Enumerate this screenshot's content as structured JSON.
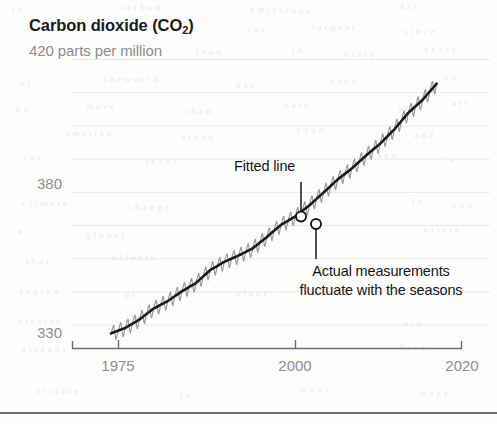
{
  "header": {
    "title_main": "Carbon dioxide (CO",
    "title_sub": "2",
    "title_close": ")",
    "title_full": "Carbon dioxide (CO2)",
    "subtitle": "420 parts per million"
  },
  "annotations": {
    "fitted": "Fitted line",
    "actual_line1": "Actual measurements",
    "actual_line2": "fluctuate with the seasons"
  },
  "axis": {
    "y_ticks": [
      "380",
      "330"
    ],
    "x_ticks": [
      "1975",
      "2000",
      "2020"
    ]
  },
  "colors": {
    "fitted_line": "#1a1a1a",
    "measurement_line": "#9a9a9a",
    "gridline": "#e8e8e6",
    "axis": "#6f6f6f",
    "tick_label": "#8e8e8e",
    "title": "#1b1b1b",
    "subtitle": "#8c8c8c",
    "background": "#fdfdfc"
  },
  "ghost_text": [
    {
      "x": 12,
      "y": 4,
      "t": "i n",
      "r": -1
    },
    {
      "x": 120,
      "y": 2,
      "t": "c a r b o n",
      "r": 0
    },
    {
      "x": 250,
      "y": 5,
      "t": "e m i s s i o n s",
      "r": 1
    },
    {
      "x": 400,
      "y": 1,
      "t": "a r e",
      "r": 0
    },
    {
      "x": 248,
      "y": 24,
      "t": "t h e",
      "r": 0
    },
    {
      "x": 312,
      "y": 22,
      "t": "l a r g e s t",
      "r": 0
    },
    {
      "x": 404,
      "y": 26,
      "t": "s i n c e",
      "r": 0
    },
    {
      "x": 196,
      "y": 47,
      "t": "t h a n",
      "r": 0
    },
    {
      "x": 292,
      "y": 45,
      "t": "i n",
      "r": 0
    },
    {
      "x": 344,
      "y": 49,
      "t": "e a r l y",
      "r": 0
    },
    {
      "x": 424,
      "y": 44,
      "t": "y e a r s",
      "r": 0
    },
    {
      "x": 20,
      "y": 78,
      "t": "o f",
      "r": 0
    },
    {
      "x": 104,
      "y": 74,
      "t": "t h e  w o r l d",
      "r": 0
    },
    {
      "x": 236,
      "y": 80,
      "t": "h a s",
      "r": 0
    },
    {
      "x": 330,
      "y": 76,
      "t": "b e e n",
      "r": 0
    },
    {
      "x": 444,
      "y": 72,
      "t": "u p",
      "r": 0
    },
    {
      "x": 16,
      "y": 104,
      "t": "b y",
      "r": 0
    },
    {
      "x": 86,
      "y": 101,
      "t": "m o r e",
      "r": 0
    },
    {
      "x": 186,
      "y": 106,
      "t": "t h a n",
      "r": 0
    },
    {
      "x": 284,
      "y": 100,
      "t": "h a l f",
      "r": 0
    },
    {
      "x": 398,
      "y": 103,
      "t": "o f",
      "r": 0
    },
    {
      "x": 452,
      "y": 98,
      "t": "a l l",
      "r": 0
    },
    {
      "x": 66,
      "y": 128,
      "t": "e m i t t e d",
      "r": 0
    },
    {
      "x": 182,
      "y": 132,
      "t": "s i n c e",
      "r": 0
    },
    {
      "x": 296,
      "y": 126,
      "t": "1 9 9 0",
      "r": 0
    },
    {
      "x": 414,
      "y": 130,
      "t": "a n d",
      "r": 0
    },
    {
      "x": 24,
      "y": 152,
      "t": "t h e",
      "r": 0
    },
    {
      "x": 146,
      "y": 156,
      "t": "l e v e l",
      "r": 0
    },
    {
      "x": 366,
      "y": 150,
      "t": "r i s e n",
      "r": 0
    },
    {
      "x": 444,
      "y": 154,
      "t": "f a r",
      "r": 0
    },
    {
      "x": 22,
      "y": 198,
      "t": "c l i m a t e",
      "r": 0
    },
    {
      "x": 128,
      "y": 202,
      "t": "c h a n g e",
      "r": 0
    },
    {
      "x": 412,
      "y": 196,
      "t": "i s",
      "r": 0
    },
    {
      "x": 452,
      "y": 200,
      "t": "n o w",
      "r": 0
    },
    {
      "x": 18,
      "y": 226,
      "t": "a",
      "r": 0
    },
    {
      "x": 86,
      "y": 230,
      "t": "g l o b a l",
      "r": 0
    },
    {
      "x": 424,
      "y": 224,
      "t": "c r i s i s",
      "r": 0
    },
    {
      "x": 26,
      "y": 256,
      "t": "t h a t",
      "r": 0
    },
    {
      "x": 112,
      "y": 252,
      "t": "a f f e c t s",
      "r": 0
    },
    {
      "x": 208,
      "y": 258,
      "t": "e v e r y",
      "r": 0
    },
    {
      "x": 20,
      "y": 286,
      "t": "r e g i o n",
      "r": 0
    },
    {
      "x": 124,
      "y": 290,
      "t": "o f",
      "r": 0
    },
    {
      "x": 180,
      "y": 284,
      "t": "t h e",
      "r": 0
    },
    {
      "x": 236,
      "y": 288,
      "t": "p l a n e t",
      "r": 0
    },
    {
      "x": 420,
      "y": 284,
      "t": "w i t h",
      "r": 0
    },
    {
      "x": 18,
      "y": 316,
      "t": "e f f e c t s",
      "r": 0
    },
    {
      "x": 126,
      "y": 312,
      "t": "t h a t",
      "r": 0
    },
    {
      "x": 404,
      "y": 318,
      "t": "a r e",
      "r": 0
    },
    {
      "x": 22,
      "y": 344,
      "t": "a l r e a d y",
      "r": 0
    },
    {
      "x": 400,
      "y": 342,
      "t": "h e r e",
      "r": 0
    },
    {
      "x": 36,
      "y": 386,
      "t": "v i s i b l e",
      "r": 0
    },
    {
      "x": 180,
      "y": 390,
      "t": "i n",
      "r": 0
    },
    {
      "x": 300,
      "y": 384,
      "t": "m a n y",
      "r": 0
    },
    {
      "x": 420,
      "y": 388,
      "t": "w a y s",
      "r": 0
    }
  ],
  "chart_data": {
    "type": "line",
    "title": "Carbon dioxide (CO2)",
    "subtitle": "420 parts per million",
    "xlabel": "",
    "ylabel": "parts per million",
    "xlim": [
      1974,
      2020.5
    ],
    "ylim": [
      326,
      420
    ],
    "x_ticks": [
      1975,
      2000,
      2020
    ],
    "y_ticks": [
      330,
      380
    ],
    "grid": "horizontal-faint",
    "legend": "none (inline annotations)",
    "series": [
      {
        "name": "Fitted line",
        "style": "solid dark trend line",
        "color": "#1a1a1a",
        "x": [
          1974,
          1976,
          1978,
          1980,
          1982,
          1984,
          1986,
          1988,
          1990,
          1992,
          1994,
          1996,
          1998,
          2000,
          2002,
          2004,
          2006,
          2008,
          2010,
          2012,
          2014,
          2016,
          2018,
          2020
        ],
        "values": [
          330.2,
          332.0,
          334.8,
          338.5,
          341.0,
          344.3,
          347.1,
          351.4,
          354.2,
          356.3,
          358.7,
          362.5,
          366.6,
          369.4,
          373.1,
          377.4,
          381.8,
          385.5,
          389.8,
          393.8,
          398.6,
          404.2,
          408.5,
          414.0
        ]
      },
      {
        "name": "Actual measurements",
        "style": "seasonal sawtooth oscillation about the fitted line",
        "color": "#9a9a9a",
        "seasonal_amplitude_ppm": 3.0,
        "cycles_per_year": 1
      }
    ],
    "annotations": [
      {
        "text": "Fitted line",
        "points_to_series": "Fitted line",
        "x": 2001,
        "y": 369
      },
      {
        "text": "Actual measurements fluctuate with the seasons",
        "points_to_series": "Actual measurements",
        "x": 2003,
        "y": 367
      }
    ]
  }
}
